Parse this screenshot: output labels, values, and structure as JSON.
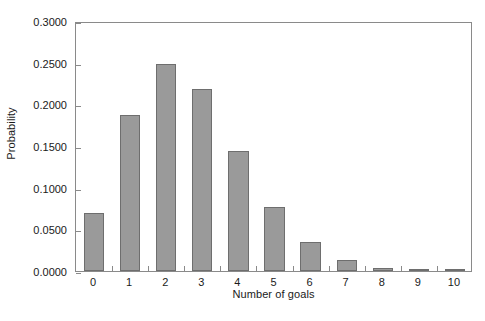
{
  "chart_data": {
    "type": "bar",
    "title": "",
    "xlabel": "Number of goals",
    "ylabel": "Probability",
    "categories": [
      "0",
      "1",
      "2",
      "3",
      "4",
      "5",
      "6",
      "7",
      "8",
      "9",
      "10"
    ],
    "values": [
      0.0695,
      0.187,
      0.249,
      0.219,
      0.1446,
      0.0772,
      0.0344,
      0.0135,
      0.004,
      0.0011,
      0.0005
    ],
    "ylim": [
      0.0,
      0.3
    ],
    "xlim": [
      -0.5,
      10.5
    ],
    "yticks": [
      0.0,
      0.05,
      0.1,
      0.15,
      0.2,
      0.25,
      0.3
    ],
    "ytick_labels": [
      "0.0000",
      "0.0500",
      "0.1000",
      "0.1500",
      "0.2000",
      "0.2500",
      "0.3000"
    ],
    "grid": false,
    "legend": null,
    "bar_color": "#9a9a9a",
    "bar_edge_color": "#6e6e6e",
    "frame_color": "#8a8a8a"
  }
}
